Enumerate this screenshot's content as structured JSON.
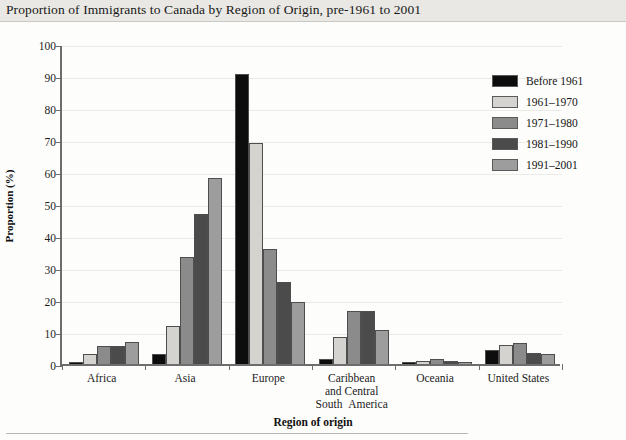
{
  "title": "Proportion of Immigrants to Canada by Region of Origin, pre-1961 to 2001",
  "axis": {
    "y_title": "Proportion (%)",
    "x_title": "Region of origin"
  },
  "colors": {
    "before_1961": "#0d0d0d",
    "p1961_1970": "#d4d3cf",
    "p1971_1980": "#8b8b8b",
    "p1981_1990": "#4b4b4b",
    "p1991_2001": "#9d9d9d",
    "axis": "#6d6d6d",
    "grid": "#eceae6",
    "title_band": "#e9e8e4"
  },
  "legend": {
    "items": [
      {
        "label": "Before 1961",
        "color": "#0d0d0d"
      },
      {
        "label": "1961–1970",
        "color": "#d4d3cf"
      },
      {
        "label": "1971–1980",
        "color": "#8b8b8b"
      },
      {
        "label": "1981–1990",
        "color": "#4b4b4b"
      },
      {
        "label": "1991–2001",
        "color": "#9d9d9d"
      }
    ]
  },
  "chart_data": {
    "type": "bar",
    "title": "Proportion of Immigrants to Canada by Region of Origin, pre-1961 to 2001",
    "xlabel": "Region of origin",
    "ylabel": "Proportion (%)",
    "ylim": [
      0,
      100
    ],
    "yticks": [
      0,
      10,
      20,
      30,
      40,
      50,
      60,
      70,
      80,
      90,
      100
    ],
    "grid": true,
    "legend_position": "top-right-outside",
    "categories": [
      "Africa",
      "Asia",
      "Europe",
      "Caribbean\nand Central\nSouth  America",
      "Oceania",
      "United States"
    ],
    "category_lines": [
      [
        "Africa"
      ],
      [
        "Asia"
      ],
      [
        "Europe"
      ],
      [
        "Caribbean",
        "and Central",
        "South  America"
      ],
      [
        "Oceania"
      ],
      [
        "United States"
      ]
    ],
    "series": [
      {
        "name": "Before 1961",
        "color": "#0d0d0d",
        "values": [
          0.5,
          3.0,
          90.5,
          1.5,
          0.4,
          4.5
        ]
      },
      {
        "name": "1961–1970",
        "color": "#d4d3cf",
        "values": [
          3.0,
          12.0,
          69.0,
          8.5,
          1.0,
          6.0
        ]
      },
      {
        "name": "1971–1980",
        "color": "#8b8b8b",
        "values": [
          5.5,
          33.5,
          36.0,
          16.5,
          1.5,
          6.5
        ]
      },
      {
        "name": "1981–1990",
        "color": "#4b4b4b",
        "values": [
          5.5,
          47.0,
          25.5,
          16.5,
          1.0,
          3.5
        ]
      },
      {
        "name": "1991–2001",
        "color": "#9d9d9d",
        "values": [
          7.0,
          58.0,
          19.5,
          10.5,
          0.6,
          3.0
        ]
      }
    ]
  }
}
